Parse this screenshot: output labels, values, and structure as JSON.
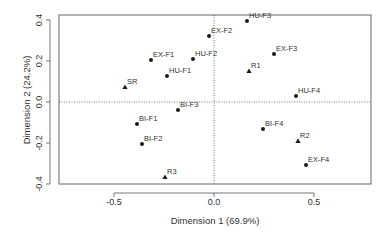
{
  "chart_data": {
    "type": "scatter",
    "title": "",
    "xlabel": "Dimension 1 (69.9%)",
    "ylabel": "Dimension 2 (24.2%)",
    "xlim": [
      -0.775,
      0.785
    ],
    "ylim": [
      -0.4,
      0.424
    ],
    "x_ticks": [
      -0.5,
      0.0,
      0.5
    ],
    "x_tick_labels": [
      "-0.5",
      "0.0",
      "0.5"
    ],
    "y_ticks": [
      -0.4,
      -0.2,
      0.0,
      0.2,
      0.4
    ],
    "y_tick_labels": [
      "-0.4",
      "-0.2",
      "0.0",
      "0.2",
      "0.4"
    ],
    "grid": false,
    "reference_lines": {
      "x": 0.0,
      "y": 0.0,
      "style": "dotted"
    },
    "legend": null,
    "series": [
      {
        "name": "circles",
        "marker": "circle",
        "points": [
          {
            "label": "EX-F1",
            "x": -0.315,
            "y": 0.205
          },
          {
            "label": "EX-F2",
            "x": -0.025,
            "y": 0.322
          },
          {
            "label": "EX-F3",
            "x": 0.3,
            "y": 0.234
          },
          {
            "label": "EX-F4",
            "x": 0.46,
            "y": -0.307
          },
          {
            "label": "HU-F1",
            "x": -0.235,
            "y": 0.127
          },
          {
            "label": "HU-F2",
            "x": -0.105,
            "y": 0.21
          },
          {
            "label": "HU-F3",
            "x": 0.165,
            "y": 0.395
          },
          {
            "label": "HU-F4",
            "x": 0.41,
            "y": 0.029
          },
          {
            "label": "BI-F1",
            "x": -0.385,
            "y": -0.107
          },
          {
            "label": "BI-F2",
            "x": -0.36,
            "y": -0.205
          },
          {
            "label": "BI-F3",
            "x": -0.18,
            "y": -0.039
          },
          {
            "label": "BI-F4",
            "x": 0.245,
            "y": -0.132
          }
        ]
      },
      {
        "name": "triangles",
        "marker": "triangle",
        "points": [
          {
            "label": "SR",
            "x": -0.445,
            "y": 0.073
          },
          {
            "label": "R1",
            "x": 0.175,
            "y": 0.151
          },
          {
            "label": "R2",
            "x": 0.42,
            "y": -0.19
          },
          {
            "label": "R3",
            "x": -0.245,
            "y": -0.366
          }
        ]
      }
    ]
  },
  "colors": {
    "points": "#1a1a1a",
    "axis": "#555555",
    "text": "#333333"
  }
}
